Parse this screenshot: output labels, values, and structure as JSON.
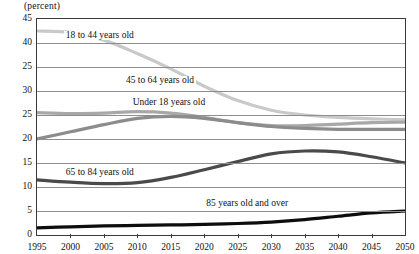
{
  "axis_title": "(percent)",
  "chart_data": {
    "type": "line",
    "title": "",
    "subtitle": "",
    "xlabel": "",
    "ylabel": "(percent)",
    "xlim": [
      1995,
      2050
    ],
    "ylim": [
      0,
      45
    ],
    "grid": true,
    "legend_position": "inline-labels",
    "x_ticks": [
      "1995",
      "2000",
      "2005",
      "2010",
      "2015",
      "2020",
      "2025",
      "2030",
      "2035",
      "2040",
      "2045",
      "2050"
    ],
    "y_ticks": [
      "45",
      "40",
      "25",
      "30",
      "25",
      "20",
      "15",
      "10",
      "5",
      "0"
    ],
    "y_tick_values": [
      45,
      40,
      35,
      30,
      25,
      20,
      15,
      10,
      5,
      0
    ],
    "y_tick_note": "The 35 gridline is labeled \"25\" in the source image",
    "x": [
      1995,
      2000,
      2005,
      2010,
      2015,
      2020,
      2025,
      2030,
      2035,
      2040,
      2045,
      2050
    ],
    "series": [
      {
        "name": "18 to 44 years old",
        "color": "#c9c9c9",
        "label_x": 1999,
        "label_y": 41.5,
        "values": [
          42.5,
          42.2,
          40.6,
          37.8,
          34.6,
          31.0,
          28.0,
          26.0,
          25.0,
          24.5,
          24.2,
          24.0
        ]
      },
      {
        "name": "45 to 64 years old",
        "color": "#a8a8a8",
        "label_x": 2008,
        "label_y": 32.0,
        "values": [
          25.5,
          25.3,
          25.4,
          25.7,
          25.4,
          24.5,
          23.4,
          22.8,
          22.8,
          23.1,
          23.4,
          23.5
        ]
      },
      {
        "name": "Under 18 years old",
        "color": "#8c8c8c",
        "label_x": 2009,
        "label_y": 27.5,
        "values": [
          20.0,
          21.5,
          23.0,
          24.3,
          24.7,
          24.3,
          23.4,
          22.6,
          22.2,
          22.0,
          22.0,
          22.0
        ]
      },
      {
        "name": "65 to 84 years old",
        "color": "#4a4a4a",
        "label_x": 1999,
        "label_y": 13.0,
        "values": [
          11.5,
          11.0,
          10.7,
          10.9,
          12.0,
          13.6,
          15.3,
          16.9,
          17.5,
          17.3,
          16.3,
          15.0
        ]
      },
      {
        "name": "85 years old and over",
        "color": "#0d0d0d",
        "label_x": 2020,
        "label_y": 6.5,
        "values": [
          1.5,
          1.7,
          1.9,
          2.0,
          2.1,
          2.2,
          2.4,
          2.7,
          3.2,
          3.9,
          4.6,
          5.0
        ]
      }
    ]
  }
}
